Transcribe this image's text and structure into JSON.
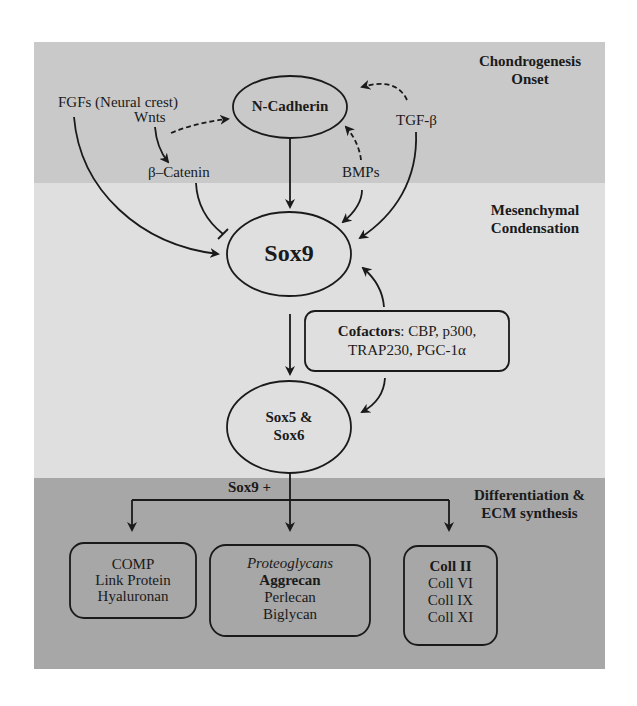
{
  "stages": {
    "top": [
      "Chondrogenesis",
      "Onset"
    ],
    "middle": [
      "Mesenchymal",
      "Condensation"
    ],
    "bottom": [
      "Differentiation &",
      "ECM synthesis"
    ]
  },
  "signals": {
    "fgfs": "FGFs (Neural crest)",
    "wnts": "Wnts",
    "beta_catenin": "β–Catenin",
    "bmps": "BMPs",
    "tgf_beta": "TGF-β"
  },
  "nodes": {
    "n_cadherin": "N-Cadherin",
    "sox9": "Sox9",
    "sox5_6_line1": "Sox5 &",
    "sox5_6_line2": "Sox6"
  },
  "cofactors": {
    "label": "Cofactors",
    "line1_rest": ": CBP, p300,",
    "line2": "TRAP230, PGC-1α"
  },
  "branch_label": "Sox9 +",
  "targets": [
    {
      "lines": [
        "COMP",
        "Link Protein",
        "Hyaluronan"
      ]
    },
    {
      "header": "Proteoglycans",
      "bold": "Aggrecan",
      "lines": [
        "Perlecan",
        "Biglycan"
      ]
    },
    {
      "bold": "Coll II",
      "lines": [
        "Coll VI",
        "Coll IX",
        "Coll XI"
      ]
    }
  ],
  "colors": {
    "band_top": "#c9c9c9",
    "band_mid": "#dfdfdf",
    "band_bot": "#a7a7a7",
    "stroke": "#1a1a1a"
  }
}
